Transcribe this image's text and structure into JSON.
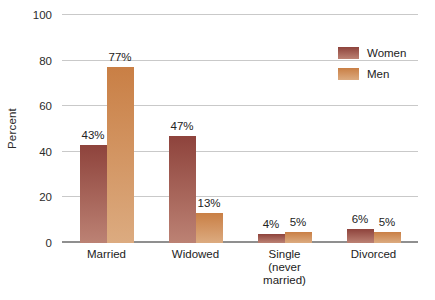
{
  "chart_data": {
    "type": "bar",
    "title": "",
    "ylabel": "Percent",
    "ylim": [
      0,
      100
    ],
    "yticks": [
      0,
      20,
      40,
      60,
      80,
      100
    ],
    "grid": true,
    "legend_position": "top-right",
    "categories": [
      "Married",
      "Widowed",
      "Single (never married)",
      "Divorced"
    ],
    "category_label_lines": [
      [
        "Married"
      ],
      [
        "Widowed"
      ],
      [
        "Single",
        "(never",
        "married)"
      ],
      [
        "Divorced"
      ]
    ],
    "series": [
      {
        "name": "Women",
        "values": [
          43,
          47,
          4,
          6
        ],
        "labels": [
          "43%",
          "47%",
          "4%",
          "6%"
        ],
        "color_top": "#8e433c",
        "color_bottom": "#bc8274"
      },
      {
        "name": "Men",
        "values": [
          77,
          13,
          5,
          5
        ],
        "labels": [
          "77%",
          "13%",
          "5%",
          "5%"
        ],
        "color_top": "#c97f45",
        "color_bottom": "#dcab80"
      }
    ]
  },
  "colors": {
    "gridline": "#c9c9c9",
    "axis_line": "#8f8f8f",
    "text": "#2b2b2b"
  }
}
